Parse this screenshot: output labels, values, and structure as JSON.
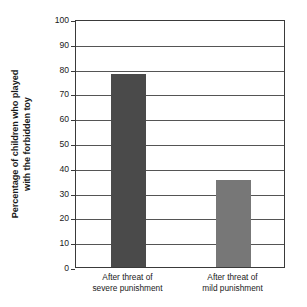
{
  "chart_data": {
    "type": "bar",
    "title": "",
    "xlabel": "",
    "ylabel_line1": "Percentage of children who played",
    "ylabel_line2": "with the forbidden toy",
    "categories": [
      "After threat of severe punishment",
      "After threat of mild punishment"
    ],
    "category_lines": [
      {
        "line1": "After threat of",
        "line2": "severe punishment"
      },
      {
        "line1": "After threat of",
        "line2": "mild punishment"
      }
    ],
    "values": [
      78,
      35
    ],
    "ylim": [
      0,
      100
    ],
    "yticks": [
      0,
      10,
      20,
      30,
      40,
      50,
      60,
      70,
      80,
      90,
      100
    ],
    "ytick_labels": [
      "0",
      "10",
      "20",
      "30",
      "40",
      "50",
      "60",
      "70",
      "80",
      "90",
      "100"
    ],
    "grid": true,
    "legend": "none",
    "bar_colors": [
      "#4a4a4a",
      "#777777"
    ],
    "frame_color": "#3a3a3a",
    "grid_color": "#555555",
    "background": "#ffffff"
  }
}
